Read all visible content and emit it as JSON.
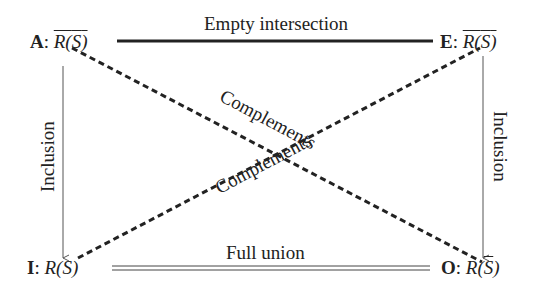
{
  "diagram": {
    "nodes": {
      "A": {
        "letter": "A",
        "sep": ":",
        "expr_head": "R(",
        "expr_arg": "S",
        "expr_tail": ")",
        "overline_all": true,
        "overline_arg": true
      },
      "E": {
        "letter": "E",
        "sep": ":",
        "expr_head": "R(",
        "expr_arg": "S",
        "expr_tail": ")",
        "overline_all": true,
        "overline_arg": false
      },
      "I": {
        "letter": "I",
        "sep": ":",
        "expr_head": "R(",
        "expr_arg": "S",
        "expr_tail": ")",
        "overline_all": false,
        "overline_arg": false
      },
      "O": {
        "letter": "O",
        "sep": ":",
        "expr_head": "R(",
        "expr_arg": "S",
        "expr_tail": ")",
        "overline_all": false,
        "overline_arg": true
      }
    },
    "edges": {
      "top": {
        "label": "Empty intersection",
        "from": "A",
        "to": "E",
        "style": "thick-solid"
      },
      "bottom": {
        "label": "Full union",
        "from": "I",
        "to": "O",
        "style": "double"
      },
      "left": {
        "label": "Inclusion",
        "from": "A",
        "to": "I",
        "style": "thin-arrow"
      },
      "right": {
        "label": "Inclusion",
        "from": "E",
        "to": "O",
        "style": "thin-arrow"
      },
      "diag_ao": {
        "label": "Complements",
        "from": "A",
        "to": "O",
        "style": "dashed"
      },
      "diag_ie": {
        "label": "Complements",
        "from": "I",
        "to": "E",
        "style": "dashed"
      }
    },
    "colors": {
      "ink": "#222222",
      "thin_line": "#555555",
      "background": "#ffffff"
    }
  }
}
